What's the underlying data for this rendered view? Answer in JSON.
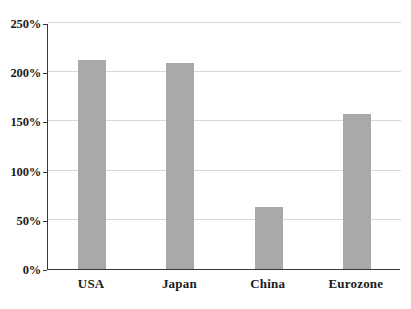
{
  "chart_data": {
    "type": "bar",
    "title": "",
    "subtitle": "",
    "xlabel": "",
    "ylabel": "",
    "categories": [
      "USA",
      "Japan",
      "China",
      "Eurozone"
    ],
    "values": [
      212,
      209,
      63,
      158
    ],
    "value_labels": [
      "212%",
      "209%",
      "63%",
      "158%"
    ],
    "series": [
      {
        "name": "",
        "values": [
          212,
          209,
          63,
          158
        ]
      }
    ],
    "ylim": [
      0,
      250
    ],
    "ytick_values": [
      0,
      50,
      100,
      150,
      200,
      250
    ],
    "ytick_labels": [
      "0%",
      "50%",
      "100%",
      "150%",
      "200%",
      "250%"
    ],
    "grid": true,
    "grid_axis": "y",
    "legend": false,
    "legend_position": "none",
    "bar_color": "#a9a9a9",
    "axis_color": "#3a3a3a",
    "grid_color": "#d8d8d8",
    "background_color": "#ffffff",
    "annotations": []
  }
}
